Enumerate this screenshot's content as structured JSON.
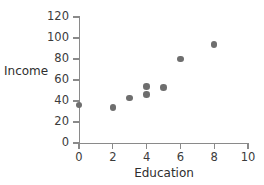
{
  "chart_data": {
    "type": "scatter",
    "title": "",
    "xlabel": "Education",
    "ylabel": "Income",
    "xlim": [
      0,
      10
    ],
    "ylim": [
      0,
      120
    ],
    "xticks": [
      0,
      2,
      4,
      6,
      8,
      10
    ],
    "yticks": [
      0,
      20,
      40,
      60,
      80,
      100,
      120
    ],
    "grid": false,
    "legend": null,
    "marker_color": "#6e6e6e",
    "axis_color": "#8a8a8a",
    "text_color": "#2e2e2e",
    "points": [
      {
        "x": 0,
        "y": 36
      },
      {
        "x": 2,
        "y": 34
      },
      {
        "x": 3,
        "y": 43
      },
      {
        "x": 4,
        "y": 54
      },
      {
        "x": 4,
        "y": 46
      },
      {
        "x": 5,
        "y": 53
      },
      {
        "x": 6,
        "y": 80
      },
      {
        "x": 8,
        "y": 94
      }
    ]
  }
}
